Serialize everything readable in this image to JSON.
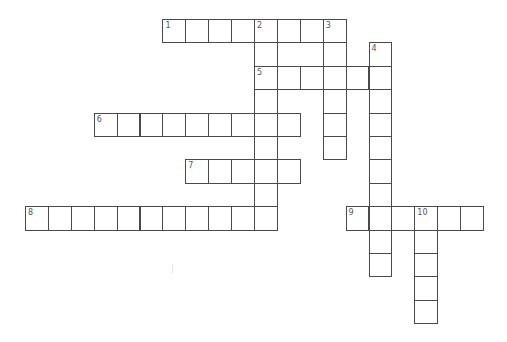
{
  "puzzle": {
    "title": "Crossword",
    "grid": {
      "origin_x": 25,
      "origin_y": 19,
      "cell_w": 22.9,
      "cell_h": 23.4
    },
    "colors": {
      "border": "#4a4a4a",
      "background": "#ffffff",
      "number": "#555555"
    },
    "entries": [
      {
        "number": "1",
        "direction": "across",
        "row": 0,
        "col": 6,
        "length": 8
      },
      {
        "number": "2",
        "direction": "down",
        "row": 0,
        "col": 10,
        "length": 9
      },
      {
        "number": "3",
        "direction": "down",
        "row": 0,
        "col": 13,
        "length": 6
      },
      {
        "number": "4",
        "direction": "down",
        "row": 1,
        "col": 15,
        "length": 10
      },
      {
        "number": "5",
        "direction": "across",
        "row": 2,
        "col": 10,
        "length": 6
      },
      {
        "number": "6",
        "direction": "across",
        "row": 4,
        "col": 3,
        "length": 9
      },
      {
        "number": "7",
        "direction": "across",
        "row": 6,
        "col": 7,
        "length": 5
      },
      {
        "number": "8",
        "direction": "across",
        "row": 8,
        "col": 0,
        "length": 11
      },
      {
        "number": "9",
        "direction": "across",
        "row": 8,
        "col": 14,
        "length": 6
      },
      {
        "number": "10",
        "direction": "down",
        "row": 8,
        "col": 17,
        "length": 5
      }
    ]
  }
}
